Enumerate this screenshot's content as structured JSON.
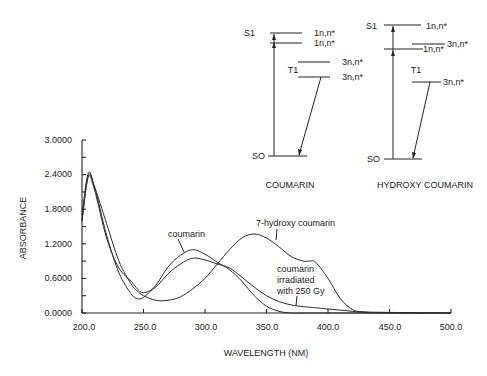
{
  "chart_data": {
    "type": "line",
    "title": "",
    "xlabel": "WAVELENGTH (NM)",
    "ylabel": "ABSORBANCE",
    "xlim": [
      200,
      500
    ],
    "ylim": [
      0,
      3
    ],
    "grid": false,
    "legend": "inline annotations",
    "x_ticks": [
      "200.0",
      "250.0",
      "300.0",
      "350.0",
      "400.0",
      "450.0",
      "500.0"
    ],
    "y_ticks": [
      "0.0000",
      "0.6000",
      "1.2000",
      "1.8000",
      "2.4000",
      "3.0000"
    ],
    "x": [
      200,
      205,
      210,
      220,
      230,
      240,
      245,
      250,
      260,
      270,
      280,
      290,
      300,
      310,
      320,
      330,
      340,
      350,
      360,
      370,
      380,
      385,
      390,
      400,
      410,
      420,
      430,
      450,
      500
    ],
    "series": [
      {
        "name": "7-hydroxy coumarin",
        "values": [
          1.6,
          2.38,
          2.2,
          1.55,
          0.9,
          0.5,
          0.38,
          0.3,
          0.22,
          0.22,
          0.28,
          0.42,
          0.6,
          0.85,
          1.1,
          1.3,
          1.37,
          1.3,
          1.15,
          0.98,
          0.9,
          0.9,
          0.88,
          0.6,
          0.25,
          0.06,
          0.02,
          0.01,
          0.0
        ]
      },
      {
        "name": "coumarin",
        "values": [
          1.7,
          2.42,
          2.2,
          1.35,
          0.7,
          0.33,
          0.25,
          0.27,
          0.48,
          0.8,
          1.0,
          1.1,
          1.02,
          0.88,
          0.75,
          0.55,
          0.3,
          0.12,
          0.03,
          0.0,
          0.0,
          0.0,
          0.0,
          0.0,
          0.0,
          0.0,
          0.0,
          0.0,
          0.0
        ]
      },
      {
        "name": "coumarin irradiated with 250 Gy",
        "values": [
          1.6,
          2.35,
          2.15,
          1.3,
          0.78,
          0.55,
          0.42,
          0.35,
          0.45,
          0.68,
          0.85,
          0.95,
          0.92,
          0.85,
          0.78,
          0.62,
          0.45,
          0.3,
          0.2,
          0.14,
          0.11,
          0.1,
          0.09,
          0.07,
          0.05,
          0.03,
          0.01,
          0.0,
          0.0
        ]
      }
    ],
    "annotations": [
      "coumarin",
      "7-hydroxy coumarin",
      "coumarin irradiated with 250 Gy"
    ]
  },
  "diagrams": [
    {
      "caption": "COUMARIN",
      "levels": {
        "s1": "S1",
        "t1": "T1",
        "s0": "SO"
      },
      "state_labels": [
        "1n,n*",
        "1n,n*",
        "3n,n*",
        "3n,n*"
      ]
    },
    {
      "caption": "HYDROXY COUMARIN",
      "levels": {
        "s1": "S1",
        "t1": "T1",
        "s0": "SO"
      },
      "state_labels": [
        "1n,n*",
        "3n,n*",
        "1n,n*",
        "3n,n*"
      ]
    }
  ],
  "annotation_lines": [
    "coumarin",
    "irradiated",
    "with 250 Gy"
  ]
}
